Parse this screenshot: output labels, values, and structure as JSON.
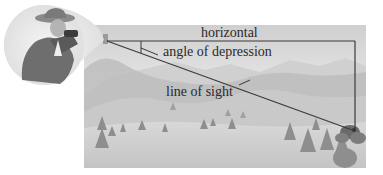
{
  "diagram": {
    "labels": {
      "horizontal": "horizontal",
      "angle": "angle of depression",
      "line_of_sight": "line of sight"
    },
    "elements": {
      "observer": "person-with-binoculars",
      "scene": "misty-mountain-landscape-with-trees",
      "target": "object-in-bushes"
    },
    "colors": {
      "line": "#3a3a3a",
      "sky_top": "#cfcfcf",
      "sky_bottom": "#f2f2f2",
      "mountain_far": "#c2c2c2",
      "mountain_mid": "#b0b0b0",
      "ground": "#d6d6d6",
      "tree": "#8e8e8e"
    }
  }
}
